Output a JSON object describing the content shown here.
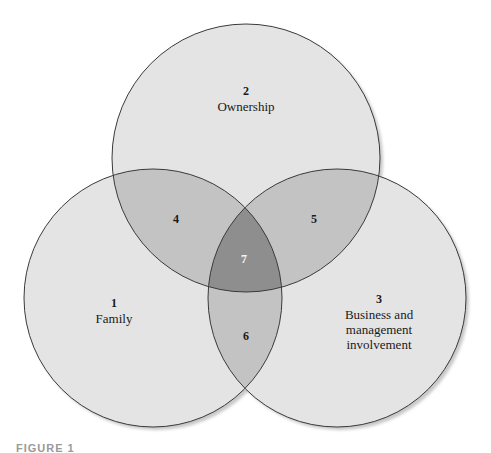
{
  "diagram": {
    "type": "venn",
    "colors": {
      "background": "#ffffff",
      "single": "#e4e4e4",
      "pair": "#c3c3c3",
      "triple": "#8e8e8e",
      "stroke": "#3a3a3a"
    },
    "circles": [
      {
        "id": "ownership",
        "number": "2",
        "label": "Ownership"
      },
      {
        "id": "family",
        "number": "1",
        "label": "Family"
      },
      {
        "id": "business",
        "number": "3",
        "label_lines": [
          "Business and",
          "management",
          "involvement"
        ]
      }
    ],
    "regions": [
      {
        "number": "4",
        "between": "Family & Ownership"
      },
      {
        "number": "5",
        "between": "Ownership & Business"
      },
      {
        "number": "6",
        "between": "Family & Business"
      },
      {
        "number": "7",
        "between": "All three"
      }
    ]
  },
  "caption": "FIGURE 1"
}
